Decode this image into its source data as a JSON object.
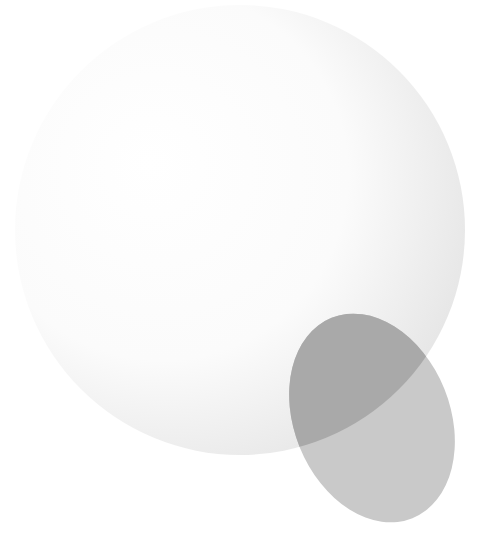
{
  "canvas": {
    "width": 499,
    "height": 558,
    "background": "#ffffff"
  },
  "shapes": {
    "large_circle": {
      "cx": 240,
      "cy": 230,
      "r": 225,
      "gradient_start": "#ffffff",
      "gradient_mid": "#fbfbfb",
      "gradient_end": "#e2e2e2"
    },
    "small_ellipse": {
      "cx": 372,
      "cy": 418,
      "rx": 78,
      "ry": 108,
      "rotate": -22,
      "color_outside": "#c9c9c9",
      "color_overlap": "#a9a9a9"
    }
  }
}
